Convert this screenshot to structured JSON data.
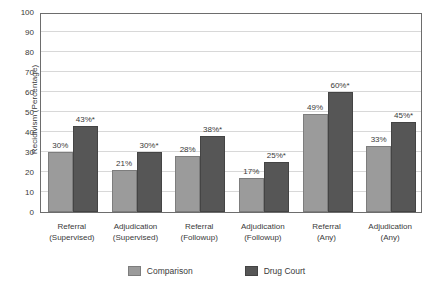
{
  "chart_data": {
    "type": "bar",
    "title": "",
    "xlabel": "",
    "ylabel": "Recidivism (Percentage)",
    "ylim": [
      0,
      100
    ],
    "ytick_labels": [
      "100",
      "90",
      "80",
      "70",
      "60",
      "50",
      "40",
      "30",
      "20",
      "10",
      "0"
    ],
    "ytick_values": [
      100,
      90,
      80,
      70,
      60,
      50,
      40,
      30,
      20,
      10,
      0
    ],
    "grid": true,
    "legend_position": "bottom-center",
    "categories": [
      "Referral (Supervised)",
      "Adjudication (Supervised)",
      "Referral (Followup)",
      "Adjudication (Followup)",
      "Referral (Any)",
      "Adjudication (Any)"
    ],
    "category_lines": [
      [
        "Referral",
        "(Supervised)"
      ],
      [
        "Adjudication",
        "(Supervised)"
      ],
      [
        "Referral",
        "(Followup)"
      ],
      [
        "Adjudication",
        "(Followup)"
      ],
      [
        "Referral",
        "(Any)"
      ],
      [
        "Adjudication",
        "(Any)"
      ]
    ],
    "series": [
      {
        "name": "Comparison",
        "color": "#9b9b9b",
        "values": [
          30,
          21,
          28,
          17,
          49,
          33
        ],
        "labels": [
          "30%",
          "21%",
          "28%",
          "17%",
          "49%",
          "33%"
        ]
      },
      {
        "name": "Drug Court",
        "color": "#565656",
        "values": [
          43,
          30,
          38,
          25,
          60,
          45
        ],
        "labels": [
          "43%*",
          "30%*",
          "38%*",
          "25%*",
          "60%*",
          "45%*"
        ]
      }
    ],
    "annotations": {
      "asterisk_note": "* marks Drug Court values"
    }
  },
  "legend": {
    "items": [
      {
        "label": "Comparison",
        "swatch": "comparison"
      },
      {
        "label": "Drug Court",
        "swatch": "drugcourt"
      }
    ]
  }
}
